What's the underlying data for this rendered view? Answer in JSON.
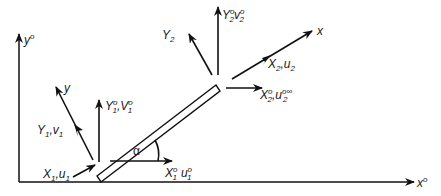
{
  "diagram": {
    "type": "force-and-velocity diagram on an inclined flat plate",
    "axes": {
      "global_x_label": "x",
      "global_x_sup": "o",
      "global_y_label": "y",
      "global_y_sup": "o",
      "local_x_label": "x",
      "local_y_label": "y"
    },
    "angle_label": "α",
    "inlet_end": {
      "axial": {
        "main": "X",
        "sub": "1",
        "sep": ",",
        "vel": "u",
        "vel_sub": "1"
      },
      "normal": {
        "main": "Y",
        "sub": "1",
        "sep": ",",
        "vel": "v",
        "vel_sub": "1"
      },
      "global_normal": {
        "main": "Y",
        "sup": "o",
        "sub": "1",
        "sep": ",",
        "vel": "V",
        "vel_sup": "o",
        "vel_sub": "1"
      },
      "global_axial": {
        "main": "X",
        "sup": "o",
        "sub": "1",
        "vel": "u",
        "vel_sup": "o",
        "vel_sub": "1"
      }
    },
    "outlet_end": {
      "normal": {
        "main": "Y",
        "sub": "2"
      },
      "global_normal": {
        "main": "Y",
        "sup": "o",
        "sub": "2",
        "vel": "v",
        "vel_sup": "o",
        "vel_sub": "2"
      },
      "axial": {
        "main": "X",
        "sub": "2",
        "sep": ",",
        "vel": "u",
        "vel_sub": "2"
      },
      "global_axial": {
        "main": "X",
        "sup": "o",
        "sub": "2",
        "sep": ",",
        "vel": "u",
        "vel_sup": "o∞",
        "vel_sub": "2"
      }
    }
  }
}
